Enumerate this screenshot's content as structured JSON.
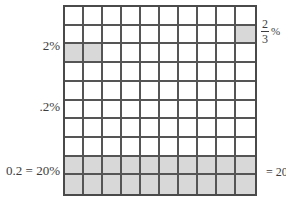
{
  "diagram": {
    "grid": {
      "rows": 10,
      "columns": 10,
      "total_cells": 100,
      "cell_fill_color": "#d8d8d8",
      "cell_empty_color": "#ffffff",
      "line_color": "#555555",
      "border_color": "#4a4a4a",
      "shaded_cells": [
        {
          "row": 2,
          "col": 10
        },
        {
          "row": 3,
          "col": 1
        },
        {
          "row": 3,
          "col": 2
        },
        {
          "row": 9,
          "col": 1
        },
        {
          "row": 9,
          "col": 2
        },
        {
          "row": 9,
          "col": 3
        },
        {
          "row": 9,
          "col": 4
        },
        {
          "row": 9,
          "col": 5
        },
        {
          "row": 9,
          "col": 6
        },
        {
          "row": 9,
          "col": 7
        },
        {
          "row": 9,
          "col": 8
        },
        {
          "row": 9,
          "col": 9
        },
        {
          "row": 9,
          "col": 10
        },
        {
          "row": 10,
          "col": 1
        },
        {
          "row": 10,
          "col": 2
        },
        {
          "row": 10,
          "col": 3
        },
        {
          "row": 10,
          "col": 4
        },
        {
          "row": 10,
          "col": 5
        },
        {
          "row": 10,
          "col": 6
        },
        {
          "row": 10,
          "col": 7
        },
        {
          "row": 10,
          "col": 8
        },
        {
          "row": 10,
          "col": 9
        },
        {
          "row": 10,
          "col": 10
        }
      ]
    },
    "labels": {
      "two_percent": "2%",
      "point_two_percent": ".2%",
      "decimal_equals_twenty_percent": "0.2 = 20%",
      "two_thirds_numerator": "2",
      "two_thirds_denominator": "3",
      "two_thirds_percent_sign": "%",
      "equals_twenty_right": "= 20"
    }
  }
}
